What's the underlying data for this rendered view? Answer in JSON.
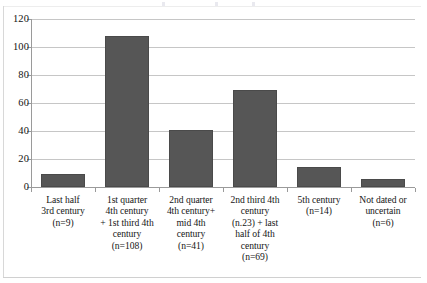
{
  "chart_data": {
    "type": "bar",
    "title": "",
    "xlabel": "",
    "ylabel": "",
    "ylim": [
      0,
      120
    ],
    "yticks": [
      0,
      20,
      40,
      60,
      80,
      100,
      120
    ],
    "ytick_labels": [
      "0",
      "20",
      "40",
      "60",
      "80",
      "100",
      "120"
    ],
    "grid": true,
    "legend": "none",
    "bar_color": "#565656",
    "gridline_color": "#c6c6c6",
    "axis_color": "#9a9a9a",
    "categories": [
      "Last half 3rd century (n=9)",
      "1st quarter 4th century + 1st third 4th century (n=108)",
      "2nd quarter 4th century+ mid 4th century (n=41)",
      "2nd third 4th century (n.23) + last half of 4th century (n=69)",
      "5th century (n=14)",
      "Not dated or uncertain (n=6)"
    ],
    "values": [
      9,
      108,
      41,
      69,
      14,
      6
    ],
    "category_lines": [
      [
        "Last half",
        "3rd century",
        "(n=9)"
      ],
      [
        "1st quarter",
        "4th century",
        "+ 1st third 4th",
        "century",
        "(n=108)"
      ],
      [
        "2nd quarter",
        "4th century+",
        "mid 4th",
        "century",
        "(n=41)"
      ],
      [
        "2nd third  4th",
        "century",
        "(n.23) + last",
        "half of  4th",
        "century",
        "(n=69)"
      ],
      [
        "5th century",
        "(n=14)"
      ],
      [
        "Not dated or",
        "uncertain",
        "(n=6)"
      ]
    ]
  }
}
